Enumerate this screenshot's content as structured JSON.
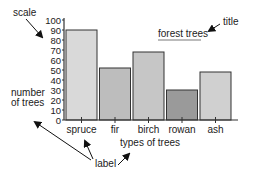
{
  "chart_data": {
    "type": "bar",
    "title": "forest trees",
    "xlabel": "types of trees",
    "ylabel": "number of trees",
    "categories": [
      "spruce",
      "fir",
      "birch",
      "rowan",
      "ash"
    ],
    "values": [
      90,
      52,
      68,
      30,
      48
    ],
    "ylim": [
      0,
      100
    ],
    "yticks": [
      "0",
      "10",
      "20",
      "30",
      "40",
      "50",
      "60",
      "70",
      "80",
      "90",
      "100"
    ],
    "grid": false,
    "legend": null,
    "bar_colors": [
      "#d9d9d9",
      "#bdbdbd",
      "#c6c6c6",
      "#9a9a9a",
      "#d0d0d0"
    ],
    "annotations": [
      {
        "text": "scale",
        "points_to": "y-axis scale"
      },
      {
        "text": "title",
        "points_to": "forest trees"
      },
      {
        "text": "label",
        "points_to": [
          "number of trees",
          "spruce",
          "types of trees"
        ]
      }
    ]
  },
  "annotations": {
    "scale": "scale",
    "title": "title",
    "label": "label"
  },
  "axis": {
    "ylabel_line1": "number",
    "ylabel_line2": "of trees"
  }
}
